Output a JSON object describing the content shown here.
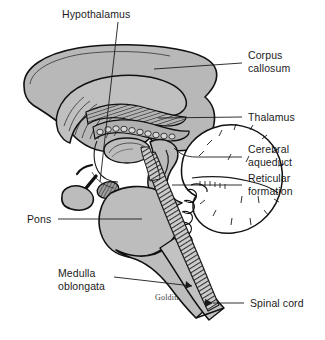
{
  "figure": {
    "signature": "Goldin",
    "background_color": "#ffffff",
    "ink_color": "#111111",
    "tissue_fill": "#b8b8b8",
    "tissue_fill_light": "#c6c6c6",
    "cerebellum_fill": "#ffffff",
    "hatch_color": "#3a3a3a"
  },
  "labels": {
    "hypothalamus": "Hypothalamus",
    "corpus_callosum_line1": "Corpus",
    "corpus_callosum_line2": "callosum",
    "thalamus": "Thalamus",
    "cerebral_aqueduct_line1": "Cerebral",
    "cerebral_aqueduct_line2": "aqueduct",
    "reticular_formation_line1": "Reticular",
    "reticular_formation_line2": "formation",
    "pons": "Pons",
    "medulla_line1": "Medulla",
    "medulla_line2": "oblongata",
    "spinal_cord": "Spinal cord"
  },
  "structures": [
    {
      "name": "cerebrum",
      "label": "Cerebrum (cortex)"
    },
    {
      "name": "corpus-callosum",
      "label": "Corpus callosum"
    },
    {
      "name": "fornix",
      "label": "Fornix"
    },
    {
      "name": "thalamus",
      "label": "Thalamus"
    },
    {
      "name": "hypothalamus",
      "label": "Hypothalamus"
    },
    {
      "name": "pituitary-gland",
      "label": "Pituitary gland"
    },
    {
      "name": "midbrain",
      "label": "Midbrain"
    },
    {
      "name": "cerebral-aqueduct",
      "label": "Cerebral aqueduct"
    },
    {
      "name": "pons",
      "label": "Pons"
    },
    {
      "name": "cerebellum",
      "label": "Cerebellum"
    },
    {
      "name": "reticular-formation",
      "label": "Reticular formation"
    },
    {
      "name": "medulla-oblongata",
      "label": "Medulla oblongata"
    },
    {
      "name": "spinal-cord",
      "label": "Spinal cord"
    }
  ]
}
